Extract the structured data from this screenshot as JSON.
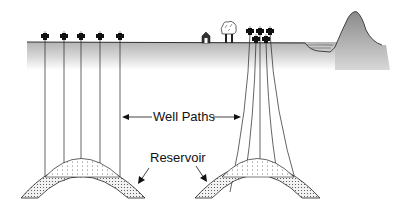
{
  "diagram": {
    "labels": {
      "well_paths": "Well Paths",
      "reservoir": "Reservoir"
    },
    "colors": {
      "line": "#222222",
      "ground_gradient_top": "#b8b8b8",
      "ground_gradient_bottom": "#ffffff",
      "mountain": "#a0a0a0",
      "reservoir_fill": "#e6e6e6",
      "wellhead": "#111111"
    },
    "left_scenario": {
      "description": "Vertical wells from separate surface locations",
      "wellhead_count": 5
    },
    "right_scenario": {
      "description": "Directional wells from a single clustered pad",
      "wellhead_count": 5,
      "surface_features": [
        "house",
        "trees",
        "pond",
        "mountain"
      ]
    }
  }
}
